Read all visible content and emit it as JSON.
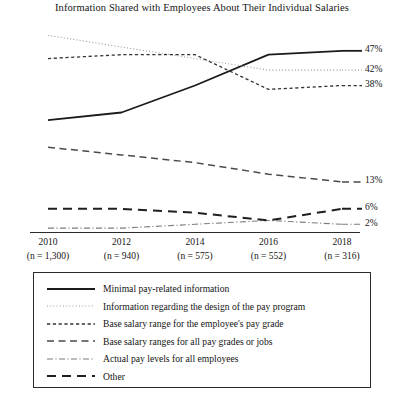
{
  "chart": {
    "title": "Information Shared with Employees About Their Individual Salaries"
  },
  "xticks": [
    {
      "year": "2010",
      "n": "(n = 1,300)"
    },
    {
      "year": "2012",
      "n": "(n = 940)"
    },
    {
      "year": "2014",
      "n": "(n = 575)"
    },
    {
      "year": "2016",
      "n": "(n = 552)"
    },
    {
      "year": "2018",
      "n": "(n = 316)"
    }
  ],
  "end_labels": [
    {
      "text": "47%"
    },
    {
      "text": "42%"
    },
    {
      "text": "38%"
    },
    {
      "text": "13%"
    },
    {
      "text": "6%"
    },
    {
      "text": "2%"
    }
  ],
  "legend": [
    {
      "label": "Minimal pay-related information",
      "style": "solid"
    },
    {
      "label": "Information regarding the design of the pay program",
      "style": "dotted"
    },
    {
      "label": "Base salary range for the employee's pay grade",
      "style": "short-dash"
    },
    {
      "label": "Base salary ranges for all pay grades or jobs",
      "style": "medium-dash"
    },
    {
      "label": "Actual pay levels for all employees",
      "style": "dash-dot"
    },
    {
      "label": "Other",
      "style": "long-dash"
    }
  ],
  "chart_data": {
    "type": "line",
    "title": "Information Shared with Employees About Their Individual Salaries",
    "xlabel": "",
    "ylabel": "",
    "x": [
      "2010",
      "2012",
      "2014",
      "2016",
      "2018"
    ],
    "x_sublabels": [
      "(n = 1,300)",
      "(n = 940)",
      "(n = 575)",
      "(n = 552)",
      "(n = 316)"
    ],
    "ylim": [
      0,
      55
    ],
    "grid": false,
    "legend_position": "bottom",
    "series": [
      {
        "name": "Minimal pay-related information",
        "style": "solid",
        "values": [
          29,
          31,
          38,
          46,
          47
        ],
        "end_label": "47%"
      },
      {
        "name": "Information regarding the design of the pay program",
        "style": "dotted",
        "values": [
          51,
          48,
          45,
          42,
          42
        ],
        "end_label": "42%"
      },
      {
        "name": "Base salary range for the employee's pay grade",
        "style": "short-dash",
        "values": [
          45,
          46,
          46,
          37,
          38
        ],
        "end_label": "38%"
      },
      {
        "name": "Base salary ranges for all pay grades or jobs",
        "style": "medium-dash",
        "values": [
          22,
          20,
          18,
          15,
          13
        ],
        "end_label": "13%"
      },
      {
        "name": "Actual pay levels for all employees",
        "style": "dash-dot",
        "values": [
          1,
          1,
          2,
          3,
          2
        ],
        "end_label": "2%"
      },
      {
        "name": "Other",
        "style": "long-dash",
        "values": [
          6,
          6,
          5,
          3,
          6
        ],
        "end_label": "6%"
      }
    ]
  }
}
